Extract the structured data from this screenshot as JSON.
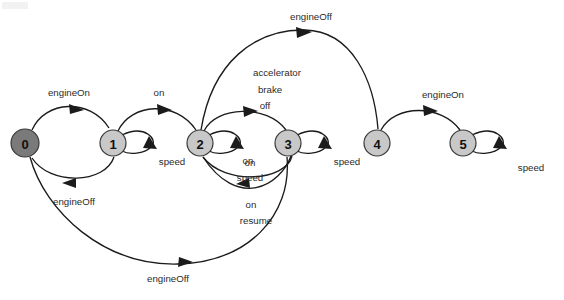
{
  "diagram": {
    "type": "state-machine",
    "title": "",
    "canvas": {
      "width": 564,
      "height": 300
    },
    "colors": {
      "background": "#ffffff",
      "node_fill_default": "#c8c8c8",
      "node_fill_initial": "#7a7a7a",
      "node_stroke": "#3a3a3a",
      "edge_stroke": "#1b1b1b",
      "label_text": "#2b2b2b"
    },
    "nodes": [
      {
        "id": "0",
        "label": "0",
        "cx": 25,
        "cy": 143,
        "r": 14,
        "initial": true,
        "fill": "#7a7a7a"
      },
      {
        "id": "1",
        "label": "1",
        "cx": 113,
        "cy": 143,
        "r": 13,
        "initial": false,
        "fill": "#c8c8c8"
      },
      {
        "id": "2",
        "label": "2",
        "cx": 200,
        "cy": 143,
        "r": 13,
        "initial": false,
        "fill": "#c8c8c8"
      },
      {
        "id": "3",
        "label": "3",
        "cx": 288,
        "cy": 143,
        "r": 13,
        "initial": false,
        "fill": "#c8c8c8"
      },
      {
        "id": "4",
        "label": "4",
        "cx": 377,
        "cy": 143,
        "r": 13,
        "initial": false,
        "fill": "#c8c8c8"
      },
      {
        "id": "5",
        "label": "5",
        "cx": 463,
        "cy": 143,
        "r": 13,
        "initial": false,
        "fill": "#c8c8c8"
      }
    ],
    "edges": [
      {
        "id": "e0to1",
        "from": "0",
        "to": "1",
        "label": "engineOn",
        "label_x": 69,
        "label_y": 93
      },
      {
        "id": "e1to0",
        "from": "1",
        "to": "0",
        "label": "engineOff",
        "label_x": 72,
        "label_y": 201
      },
      {
        "id": "e1to2",
        "from": "1",
        "to": "2",
        "label": "on",
        "label_x": 157,
        "label_y": 93
      },
      {
        "id": "e2to3",
        "from": "2",
        "to": "3",
        "label": "accelerator brake off",
        "label_lines": [
          "accelerator",
          "brake",
          "off"
        ],
        "label_x": 266,
        "label_y": 73
      },
      {
        "id": "e3to2",
        "from": "3",
        "to": "2",
        "label": "on speed",
        "label_lines": [
          "on",
          "speed"
        ],
        "label_x": 247,
        "label_y": 162
      },
      {
        "id": "e2to4",
        "from": "2",
        "to": "4",
        "label": "engineOff",
        "label_x": 311,
        "label_y": 18
      },
      {
        "id": "e3to0",
        "from": "3",
        "to": "0",
        "label": "engineOff",
        "label_x": 168,
        "label_y": 279
      },
      {
        "id": "e2from3",
        "from": "3",
        "to": "2",
        "label": "on resume",
        "label_lines": [
          "on",
          "resume"
        ],
        "label_x": 251,
        "label_y": 206
      },
      {
        "id": "e4to5",
        "from": "4",
        "to": "5",
        "label": "engineOn",
        "label_x": 441,
        "label_y": 95
      }
    ],
    "self_loops": [
      {
        "id": "loop1",
        "node": "1",
        "label": "speed",
        "label_x": 170,
        "label_y": 162
      },
      {
        "id": "loop2",
        "node": "2",
        "label": "on",
        "label_x": 250,
        "label_y": 164
      },
      {
        "id": "loop3",
        "node": "3",
        "label": "speed",
        "label_x": 345,
        "label_y": 162
      },
      {
        "id": "loop5",
        "node": "5",
        "label": "speed",
        "label_x": 530,
        "label_y": 168
      }
    ]
  }
}
